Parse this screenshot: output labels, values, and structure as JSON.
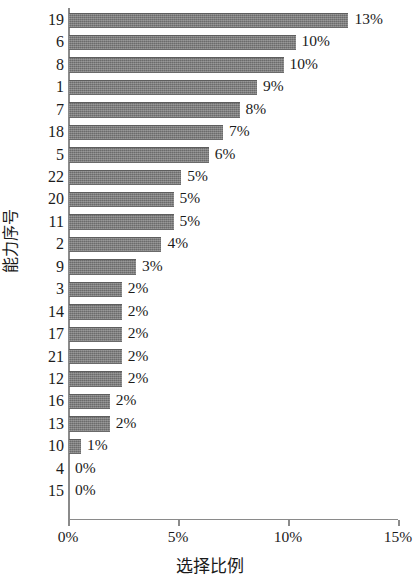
{
  "chart_data": {
    "type": "bar",
    "orientation": "horizontal",
    "title": "",
    "xlabel": "选择比例",
    "ylabel": "能力序号",
    "xlim": [
      0,
      15
    ],
    "xunit": "%",
    "grid": false,
    "legend": null,
    "bar_color": "#767676",
    "axis_color": "#8a8a8a",
    "categories": [
      "19",
      "6",
      "8",
      "1",
      "7",
      "18",
      "5",
      "22",
      "20",
      "11",
      "2",
      "9",
      "3",
      "14",
      "17",
      "21",
      "12",
      "16",
      "13",
      "10",
      "4",
      "15"
    ],
    "values": [
      12.7,
      10.3,
      9.75,
      8.55,
      7.75,
      7.0,
      6.35,
      5.1,
      4.75,
      4.75,
      4.2,
      3.05,
      2.4,
      2.4,
      2.4,
      2.4,
      2.4,
      1.85,
      1.85,
      0.55,
      0.0,
      0.0
    ],
    "data_labels": [
      "13%",
      "10%",
      "10%",
      "9%",
      "8%",
      "7%",
      "6%",
      "5%",
      "5%",
      "5%",
      "4%",
      "3%",
      "2%",
      "2%",
      "2%",
      "2%",
      "2%",
      "2%",
      "2%",
      "1%",
      "0%",
      "0%"
    ],
    "xticks": [
      0,
      5,
      10,
      15
    ],
    "xtick_labels": [
      "0%",
      "5%",
      "10%",
      "15%"
    ]
  }
}
